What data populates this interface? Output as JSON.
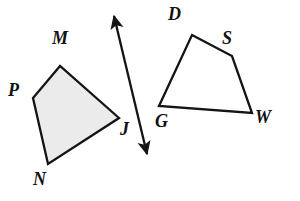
{
  "figure": {
    "background_color": "#ffffff",
    "stroke_color": "#141414",
    "label_color": "#121212"
  },
  "shapes": [
    {
      "name": "quadrilateral-mpnj",
      "label_sequence": "M P N J",
      "filled": true,
      "fill_color": "#ebebeb",
      "stroke_color": "#141414",
      "stroke_width": 2.3,
      "points": "60,66 33,98 48,164 119,118",
      "vertices": [
        {
          "id": "M",
          "label": "M",
          "x": 60,
          "y": 66
        },
        {
          "id": "P",
          "label": "P",
          "x": 33,
          "y": 98
        },
        {
          "id": "N",
          "label": "N",
          "x": 48,
          "y": 164
        },
        {
          "id": "J",
          "label": "J",
          "x": 119,
          "y": 118
        }
      ]
    },
    {
      "name": "quadrilateral-dswg",
      "label_sequence": "D S W G",
      "filled": false,
      "fill_color": "none",
      "stroke_color": "#141414",
      "stroke_width": 2.3,
      "points": "192,35 232,56 252,113 159,106",
      "vertices": [
        {
          "id": "D",
          "label": "D",
          "x": 192,
          "y": 35
        },
        {
          "id": "S",
          "label": "S",
          "x": 232,
          "y": 56
        },
        {
          "id": "W",
          "label": "W",
          "x": 252,
          "y": 113
        },
        {
          "id": "G",
          "label": "G",
          "x": 159,
          "y": 106
        }
      ]
    }
  ],
  "arrow": {
    "name": "double-headed-arrow",
    "description": "line of reflection / separator arrow between the two quadrilaterals",
    "stroke_color": "#141414",
    "stroke_width": 2.3,
    "start_x": 114,
    "start_y": 16,
    "end_x": 147,
    "end_y": 154,
    "double_headed": true
  },
  "labels": [
    {
      "id": "label-M",
      "text": "M",
      "x": 52,
      "y": 29,
      "font_size": 18
    },
    {
      "id": "label-P",
      "text": "P",
      "x": 8,
      "y": 81,
      "font_size": 18
    },
    {
      "id": "label-N",
      "text": "N",
      "x": 33,
      "y": 170,
      "font_size": 18
    },
    {
      "id": "label-J",
      "text": "J",
      "x": 120,
      "y": 120,
      "font_size": 18
    },
    {
      "id": "label-D",
      "text": "D",
      "x": 168,
      "y": 5,
      "font_size": 18
    },
    {
      "id": "label-S",
      "text": "S",
      "x": 222,
      "y": 29,
      "font_size": 18
    },
    {
      "id": "label-G",
      "text": "G",
      "x": 155,
      "y": 112,
      "font_size": 18
    },
    {
      "id": "label-W",
      "text": "W",
      "x": 255,
      "y": 108,
      "font_size": 18
    }
  ]
}
